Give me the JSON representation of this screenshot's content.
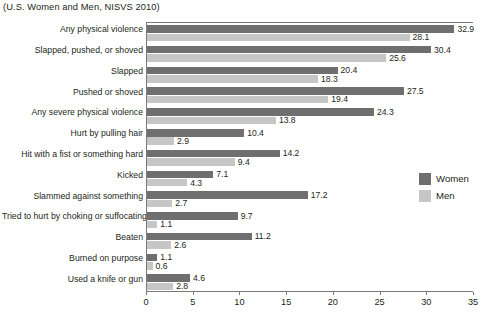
{
  "chart_data": {
    "type": "bar",
    "orientation": "horizontal",
    "title": "(U.S. Women and Men, NISVS 2010)",
    "xlabel": "",
    "ylabel": "",
    "xlim": [
      0,
      35
    ],
    "xticks": [
      0,
      5,
      10,
      15,
      20,
      25,
      30,
      35
    ],
    "grid": false,
    "legend_position": "right",
    "categories": [
      "Any physical violence",
      "Slapped, pushed, or shoved",
      "Slapped",
      "Pushed or shoved",
      "Any severe physical violence",
      "Hurt by pulling hair",
      "Hit with a fist or something hard",
      "Kicked",
      "Slammed against something",
      "Tried to hurt by choking or suffocating",
      "Beaten",
      "Burned on purpose",
      "Used a knife or gun"
    ],
    "series": [
      {
        "name": "Women",
        "color": "#6f6f6f",
        "values": [
          32.9,
          30.4,
          20.4,
          27.5,
          24.3,
          10.4,
          14.2,
          7.1,
          17.2,
          9.7,
          11.2,
          1.1,
          4.6
        ]
      },
      {
        "name": "Men",
        "color": "#c6c6c6",
        "values": [
          28.1,
          25.6,
          18.3,
          19.4,
          13.8,
          2.9,
          9.4,
          4.3,
          2.7,
          1.1,
          2.6,
          0.6,
          2.8
        ]
      }
    ]
  },
  "legend": {
    "items": [
      {
        "label": "Women",
        "color": "#6f6f6f"
      },
      {
        "label": "Men",
        "color": "#c6c6c6"
      }
    ]
  }
}
